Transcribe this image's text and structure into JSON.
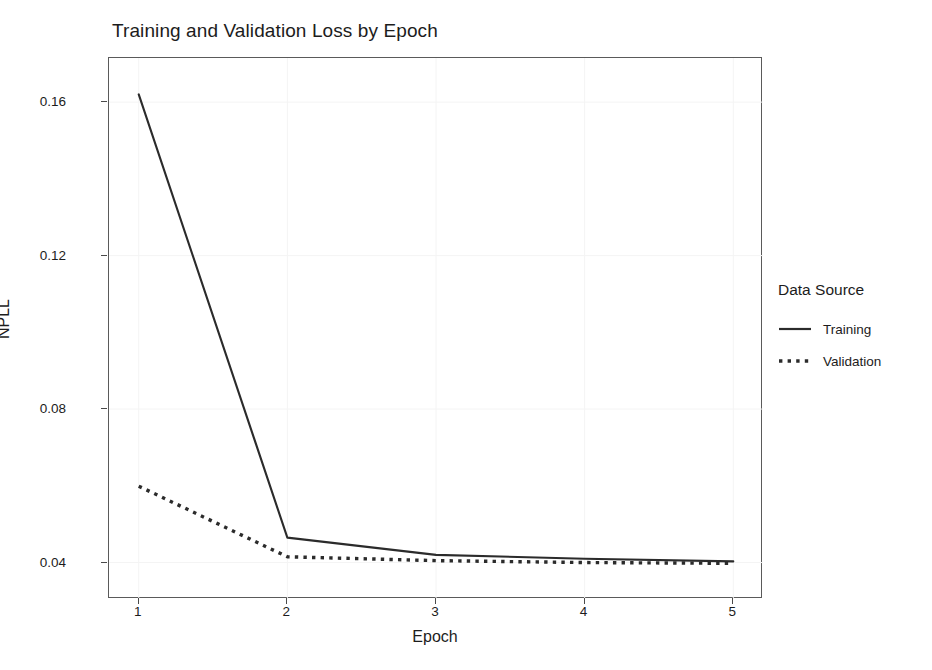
{
  "chart_data": {
    "type": "line",
    "title": "Training and Validation Loss by Epoch",
    "xlabel": "Epoch",
    "ylabel": "NPLL",
    "x": [
      1,
      2,
      3,
      4,
      5
    ],
    "xticklabels": [
      "1",
      "2",
      "3",
      "4",
      "5"
    ],
    "yticks": [
      0.04,
      0.08,
      0.12,
      0.16
    ],
    "yticklabels": [
      "0.04",
      "0.08",
      "0.12",
      "0.16"
    ],
    "xlim": [
      0.8,
      5.2
    ],
    "ylim": [
      0.0305,
      0.1715
    ],
    "grid": "faint",
    "legend": {
      "title": "Data Source",
      "position": "right",
      "entries": [
        {
          "label": "Training",
          "style": "solid"
        },
        {
          "label": "Validation",
          "style": "dotted"
        }
      ]
    },
    "series": [
      {
        "name": "Training",
        "style": "solid",
        "color": "#2b2b2b",
        "values": [
          0.162,
          0.0465,
          0.042,
          0.041,
          0.0403
        ]
      },
      {
        "name": "Validation",
        "style": "dotted",
        "color": "#2b2b2b",
        "values": [
          0.0599,
          0.0415,
          0.0405,
          0.04,
          0.0398
        ]
      }
    ]
  },
  "colors": {
    "background": "#ffffff",
    "axis": "#5a5a5a",
    "ink": "#1c1c1c",
    "grid": "#f4f4f4"
  }
}
